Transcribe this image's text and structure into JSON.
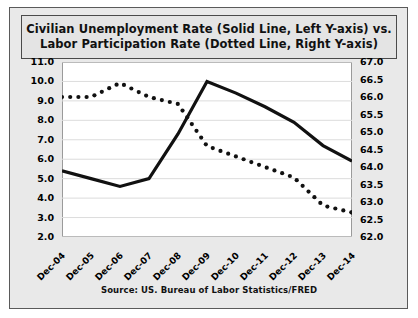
{
  "title": {
    "line1": "Civilian Unemployment Rate (Solid Line, Left Y-axis) vs.",
    "line2": "Labor Participation Rate (Dotted Line, Right Y-axis)"
  },
  "source_note": "Source: US. Bureau of Labor Statistics/FRED",
  "colors": {
    "line": "#111111",
    "plot_background": "#ffffff",
    "panel_background": "#e9e9e9",
    "title_background": "#e4e4e4",
    "border": "#4a4a4a",
    "gridline": "#dcdcdc"
  },
  "chart_data": {
    "type": "line",
    "title": "Civilian Unemployment Rate (Solid Line, Left Y-axis) vs. Labor Participation Rate (Dotted Line, Right Y-axis)",
    "xlabel": "",
    "ylabel": "",
    "grid": true,
    "legend": "none",
    "categories": [
      "Dec-04",
      "Dec-05",
      "Dec-06",
      "Dec-07",
      "Dec-08",
      "Dec-09",
      "Dec-10",
      "Dec-11",
      "Dec-12",
      "Dec-13",
      "Dec-14"
    ],
    "y_left": {
      "label": "Civilian Unemployment Rate",
      "ylim": [
        2.0,
        11.0
      ],
      "ticks": [
        "11.0",
        "10.0",
        "9.0",
        "8.0",
        "7.0",
        "6.0",
        "5.0",
        "4.0",
        "3.0",
        "2.0"
      ],
      "tick_values": [
        11.0,
        10.0,
        9.0,
        8.0,
        7.0,
        6.0,
        5.0,
        4.0,
        3.0,
        2.0
      ]
    },
    "y_right": {
      "label": "Labor Participation Rate",
      "ylim": [
        62.0,
        67.0
      ],
      "ticks": [
        "67.0",
        "66.5",
        "66.0",
        "65.5",
        "65.0",
        "64.5",
        "64.0",
        "63.5",
        "63.0",
        "62.5",
        "62.0"
      ],
      "tick_values": [
        67.0,
        66.5,
        66.0,
        65.5,
        65.0,
        64.5,
        64.0,
        63.5,
        63.0,
        62.5,
        62.0
      ]
    },
    "series": [
      {
        "name": "Civilian Unemployment Rate",
        "style": "solid",
        "axis": "left",
        "values": [
          5.4,
          5.0,
          4.6,
          5.0,
          7.3,
          10.0,
          9.4,
          8.7,
          7.9,
          6.7,
          5.9
        ]
      },
      {
        "name": "Labor Participation Rate",
        "style": "dotted",
        "axis": "right",
        "values": [
          66.0,
          66.0,
          66.4,
          66.0,
          65.8,
          64.6,
          64.3,
          64.0,
          63.7,
          62.9,
          62.7
        ]
      }
    ]
  }
}
